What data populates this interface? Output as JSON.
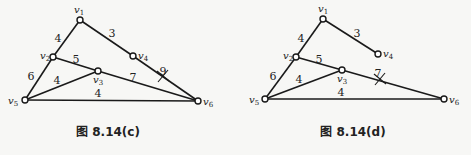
{
  "figures": [
    {
      "caption": "图 8.14(c)",
      "nodes": [
        {
          "id": "v1",
          "x": 80,
          "y": 20,
          "label": "v",
          "sub": "1",
          "lx": 74,
          "ly": 13
        },
        {
          "id": "v2",
          "x": 53,
          "y": 57,
          "label": "v",
          "sub": "2",
          "lx": 40,
          "ly": 59
        },
        {
          "id": "v3",
          "x": 98,
          "y": 71,
          "label": "v",
          "sub": "3",
          "lx": 93,
          "ly": 83
        },
        {
          "id": "v4",
          "x": 133,
          "y": 56,
          "label": "v",
          "sub": "4",
          "lx": 138,
          "ly": 59
        },
        {
          "id": "v5",
          "x": 25,
          "y": 100,
          "label": "v",
          "sub": "5",
          "lx": 8,
          "ly": 104
        },
        {
          "id": "v6",
          "x": 198,
          "y": 101,
          "label": "v",
          "sub": "6",
          "lx": 203,
          "ly": 105
        }
      ],
      "edges": [
        {
          "from": "v1",
          "to": "v2",
          "weight": "4",
          "wx": 58,
          "wy": 42
        },
        {
          "from": "v1",
          "to": "v4",
          "weight": "3",
          "wx": 112,
          "wy": 37
        },
        {
          "from": "v4",
          "to": "v6",
          "weight": "9",
          "wx": 163,
          "wy": 75,
          "crossed": true,
          "cx": 163,
          "cy": 76
        },
        {
          "from": "v2",
          "to": "v3",
          "weight": "5",
          "wx": 76,
          "wy": 63
        },
        {
          "from": "v2",
          "to": "v5",
          "weight": "6",
          "wx": 31,
          "wy": 80
        },
        {
          "from": "v3",
          "to": "v5",
          "weight": "4",
          "wx": 57,
          "wy": 84
        },
        {
          "from": "v3",
          "to": "v6",
          "weight": "7",
          "wx": 133,
          "wy": 81
        },
        {
          "from": "v5",
          "to": "v6",
          "weight": "4",
          "wx": 98,
          "wy": 97
        }
      ],
      "caption_pos": {
        "x": 108,
        "y": 136
      }
    },
    {
      "caption": "图 8.14(d)",
      "nodes": [
        {
          "id": "v1",
          "x": 323,
          "y": 19,
          "label": "v",
          "sub": "1",
          "lx": 318,
          "ly": 12
        },
        {
          "id": "v2",
          "x": 296,
          "y": 57,
          "label": "v",
          "sub": "2",
          "lx": 283,
          "ly": 59
        },
        {
          "id": "v3",
          "x": 342,
          "y": 70,
          "label": "v",
          "sub": "3",
          "lx": 337,
          "ly": 82
        },
        {
          "id": "v4",
          "x": 378,
          "y": 54,
          "label": "v",
          "sub": "4",
          "lx": 383,
          "ly": 57
        },
        {
          "id": "v5",
          "x": 265,
          "y": 99,
          "label": "v",
          "sub": "5",
          "lx": 249,
          "ly": 103
        },
        {
          "id": "v6",
          "x": 444,
          "y": 99,
          "label": "v",
          "sub": "6",
          "lx": 449,
          "ly": 103
        }
      ],
      "edges": [
        {
          "from": "v1",
          "to": "v2",
          "weight": "4",
          "wx": 301,
          "wy": 42
        },
        {
          "from": "v1",
          "to": "v4",
          "weight": "3",
          "wx": 357,
          "wy": 37
        },
        {
          "from": "v2",
          "to": "v3",
          "weight": "5",
          "wx": 319,
          "wy": 63
        },
        {
          "from": "v2",
          "to": "v5",
          "weight": "6",
          "wx": 273,
          "wy": 80
        },
        {
          "from": "v3",
          "to": "v5",
          "weight": "4",
          "wx": 299,
          "wy": 83
        },
        {
          "from": "v3",
          "to": "v6",
          "weight": "7",
          "wx": 378,
          "wy": 77,
          "crossed": true,
          "cx": 380,
          "cy": 79
        },
        {
          "from": "v5",
          "to": "v6",
          "weight": "4",
          "wx": 341,
          "wy": 96
        }
      ],
      "caption_pos": {
        "x": 353,
        "y": 136
      }
    }
  ]
}
